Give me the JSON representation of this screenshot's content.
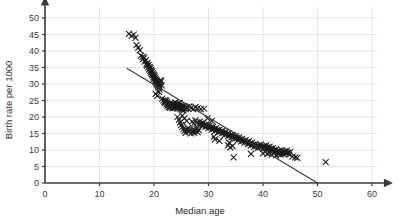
{
  "chart_data": {
    "type": "scatter",
    "title": "",
    "xlabel": "Median age",
    "ylabel": "Birth rate per 1000",
    "xlim": [
      0,
      62
    ],
    "ylim": [
      0,
      52
    ],
    "xticks": [
      0,
      10,
      20,
      30,
      40,
      50,
      60
    ],
    "yticks": [
      0,
      5,
      10,
      15,
      20,
      25,
      30,
      35,
      40,
      45,
      50
    ],
    "xtick_labels": [
      "0",
      "10",
      "20",
      "30",
      "40",
      "50",
      "60"
    ],
    "ytick_labels": [
      "0",
      "5",
      "10",
      "15",
      "20",
      "25",
      "30",
      "35",
      "40",
      "45",
      "50"
    ],
    "grid": true,
    "grid_color": "#e3e3e3",
    "axis_color": "#3a3a3a",
    "marker": "x",
    "marker_color": "#1a1a1a",
    "marker_size": 3.0,
    "legend": null,
    "trend_line": {
      "label": "",
      "color": "#3a3a3a",
      "x0": 15.0,
      "y0": 34.8,
      "x1": 50.0,
      "y1": 0.0
    },
    "annotations": [],
    "points": [
      [
        15.4,
        45.2
      ],
      [
        15.9,
        44.6
      ],
      [
        16.3,
        45.0
      ],
      [
        16.6,
        44.0
      ],
      [
        16.8,
        41.8
      ],
      [
        17.1,
        41.0
      ],
      [
        17.4,
        40.2
      ],
      [
        17.6,
        38.6
      ],
      [
        17.9,
        38.2
      ],
      [
        18.0,
        37.6
      ],
      [
        18.2,
        38.0
      ],
      [
        18.3,
        36.8
      ],
      [
        18.5,
        37.2
      ],
      [
        18.6,
        36.0
      ],
      [
        18.7,
        35.6
      ],
      [
        18.8,
        36.4
      ],
      [
        18.9,
        35.0
      ],
      [
        19.0,
        35.8
      ],
      [
        19.1,
        34.4
      ],
      [
        19.2,
        35.2
      ],
      [
        19.3,
        34.0
      ],
      [
        19.35,
        34.8
      ],
      [
        19.4,
        33.4
      ],
      [
        19.5,
        34.2
      ],
      [
        19.6,
        33.0
      ],
      [
        19.65,
        33.8
      ],
      [
        19.7,
        32.6
      ],
      [
        19.8,
        33.2
      ],
      [
        19.9,
        32.0
      ],
      [
        19.95,
        32.8
      ],
      [
        20.0,
        31.6
      ],
      [
        20.1,
        32.4
      ],
      [
        20.15,
        31.0
      ],
      [
        20.2,
        31.8
      ],
      [
        20.3,
        30.6
      ],
      [
        20.35,
        31.4
      ],
      [
        20.4,
        30.2
      ],
      [
        20.5,
        31.0
      ],
      [
        20.55,
        29.8
      ],
      [
        20.6,
        30.6
      ],
      [
        20.7,
        29.4
      ],
      [
        20.75,
        30.2
      ],
      [
        20.8,
        29.0
      ],
      [
        20.9,
        29.8
      ],
      [
        21.0,
        28.4
      ],
      [
        21.05,
        29.2
      ],
      [
        21.1,
        30.4
      ],
      [
        21.2,
        31.2
      ],
      [
        21.3,
        30.8
      ],
      [
        21.4,
        29.6
      ],
      [
        20.3,
        27.0
      ],
      [
        20.6,
        26.4
      ],
      [
        20.9,
        27.6
      ],
      [
        21.5,
        25.6
      ],
      [
        21.7,
        25.0
      ],
      [
        21.9,
        24.6
      ],
      [
        22.0,
        24.2
      ],
      [
        22.1,
        25.2
      ],
      [
        22.2,
        24.8
      ],
      [
        22.3,
        23.8
      ],
      [
        22.4,
        24.4
      ],
      [
        22.5,
        23.4
      ],
      [
        22.6,
        24.0
      ],
      [
        22.7,
        23.0
      ],
      [
        22.8,
        23.6
      ],
      [
        22.9,
        22.8
      ],
      [
        23.0,
        23.4
      ],
      [
        23.1,
        24.2
      ],
      [
        23.2,
        23.0
      ],
      [
        23.3,
        23.8
      ],
      [
        23.4,
        22.6
      ],
      [
        23.5,
        23.4
      ],
      [
        23.6,
        24.0
      ],
      [
        23.7,
        22.8
      ],
      [
        23.8,
        23.6
      ],
      [
        23.9,
        24.4
      ],
      [
        24.0,
        23.2
      ],
      [
        24.1,
        23.8
      ],
      [
        24.2,
        22.6
      ],
      [
        24.3,
        23.4
      ],
      [
        24.4,
        24.0
      ],
      [
        24.5,
        22.8
      ],
      [
        24.6,
        23.4
      ],
      [
        24.7,
        24.2
      ],
      [
        24.8,
        22.4
      ],
      [
        24.9,
        23.0
      ],
      [
        25.0,
        23.6
      ],
      [
        25.1,
        22.2
      ],
      [
        25.2,
        22.8
      ],
      [
        25.3,
        23.4
      ],
      [
        25.4,
        22.0
      ],
      [
        25.5,
        22.6
      ],
      [
        25.6,
        23.2
      ],
      [
        25.8,
        22.4
      ],
      [
        26.0,
        23.0
      ],
      [
        26.2,
        22.6
      ],
      [
        26.5,
        23.2
      ],
      [
        26.8,
        22.8
      ],
      [
        27.2,
        22.4
      ],
      [
        27.6,
        23.0
      ],
      [
        28.0,
        22.6
      ],
      [
        28.6,
        22.4
      ],
      [
        29.2,
        22.5
      ],
      [
        24.3,
        20.0
      ],
      [
        24.6,
        19.2
      ],
      [
        24.8,
        18.4
      ],
      [
        25.0,
        17.6
      ],
      [
        25.2,
        17.0
      ],
      [
        25.4,
        16.4
      ],
      [
        25.6,
        15.8
      ],
      [
        25.8,
        15.2
      ],
      [
        26.0,
        16.0
      ],
      [
        26.2,
        16.6
      ],
      [
        26.4,
        15.6
      ],
      [
        26.6,
        16.2
      ],
      [
        26.8,
        15.0
      ],
      [
        27.0,
        15.6
      ],
      [
        27.2,
        16.2
      ],
      [
        27.4,
        15.2
      ],
      [
        27.6,
        15.8
      ],
      [
        27.8,
        16.4
      ],
      [
        28.0,
        15.4
      ],
      [
        28.2,
        16.0
      ],
      [
        27.0,
        18.6
      ],
      [
        27.3,
        18.0
      ],
      [
        27.6,
        19.0
      ],
      [
        27.9,
        18.4
      ],
      [
        28.2,
        17.8
      ],
      [
        28.4,
        18.6
      ],
      [
        28.6,
        18.0
      ],
      [
        28.8,
        17.4
      ],
      [
        29.0,
        18.2
      ],
      [
        29.2,
        17.6
      ],
      [
        29.4,
        17.0
      ],
      [
        29.6,
        17.8
      ],
      [
        29.8,
        17.2
      ],
      [
        30.0,
        16.6
      ],
      [
        30.2,
        17.4
      ],
      [
        30.4,
        16.8
      ],
      [
        30.6,
        16.2
      ],
      [
        30.8,
        17.0
      ],
      [
        31.0,
        16.4
      ],
      [
        31.2,
        15.8
      ],
      [
        31.4,
        16.6
      ],
      [
        31.6,
        16.0
      ],
      [
        31.8,
        15.4
      ],
      [
        32.0,
        16.2
      ],
      [
        32.2,
        15.6
      ],
      [
        32.4,
        15.0
      ],
      [
        32.6,
        15.8
      ],
      [
        32.8,
        15.2
      ],
      [
        33.0,
        14.6
      ],
      [
        33.2,
        15.4
      ],
      [
        33.4,
        14.8
      ],
      [
        33.6,
        14.2
      ],
      [
        33.8,
        15.0
      ],
      [
        34.0,
        14.4
      ],
      [
        34.2,
        13.8
      ],
      [
        34.4,
        14.6
      ],
      [
        34.6,
        14.0
      ],
      [
        34.8,
        13.4
      ],
      [
        35.0,
        14.2
      ],
      [
        35.2,
        13.6
      ],
      [
        35.4,
        13.0
      ],
      [
        35.6,
        13.8
      ],
      [
        35.8,
        13.2
      ],
      [
        36.0,
        12.6
      ],
      [
        36.2,
        13.4
      ],
      [
        36.4,
        12.8
      ],
      [
        36.6,
        12.2
      ],
      [
        36.8,
        13.0
      ],
      [
        37.0,
        12.4
      ],
      [
        37.2,
        11.8
      ],
      [
        37.4,
        12.6
      ],
      [
        37.6,
        12.0
      ],
      [
        37.8,
        11.4
      ],
      [
        38.0,
        12.2
      ],
      [
        38.2,
        11.6
      ],
      [
        38.4,
        11.0
      ],
      [
        38.6,
        11.8
      ],
      [
        38.8,
        11.2
      ],
      [
        39.0,
        10.6
      ],
      [
        39.2,
        11.4
      ],
      [
        39.4,
        10.8
      ],
      [
        39.6,
        11.6
      ],
      [
        39.8,
        11.0
      ],
      [
        40.0,
        10.4
      ],
      [
        40.2,
        11.2
      ],
      [
        40.4,
        10.6
      ],
      [
        40.6,
        11.4
      ],
      [
        40.8,
        10.8
      ],
      [
        41.0,
        10.2
      ],
      [
        41.2,
        11.0
      ],
      [
        41.4,
        10.4
      ],
      [
        41.6,
        9.8
      ],
      [
        41.8,
        10.6
      ],
      [
        42.0,
        10.0
      ],
      [
        42.2,
        9.4
      ],
      [
        42.4,
        10.2
      ],
      [
        42.6,
        9.6
      ],
      [
        42.8,
        9.0
      ],
      [
        43.0,
        9.8
      ],
      [
        43.2,
        9.2
      ],
      [
        43.4,
        10.0
      ],
      [
        43.6,
        9.4
      ],
      [
        43.8,
        8.8
      ],
      [
        44.0,
        9.6
      ],
      [
        44.2,
        9.0
      ],
      [
        44.4,
        9.8
      ],
      [
        44.6,
        9.2
      ],
      [
        44.8,
        8.6
      ],
      [
        45.0,
        9.4
      ],
      [
        45.4,
        8.0
      ],
      [
        45.9,
        7.8
      ],
      [
        46.3,
        7.6
      ],
      [
        40.0,
        9.0
      ],
      [
        40.4,
        9.4
      ],
      [
        40.8,
        8.8
      ],
      [
        41.2,
        9.2
      ],
      [
        41.6,
        8.6
      ],
      [
        42.0,
        9.0
      ],
      [
        42.4,
        8.4
      ],
      [
        42.8,
        8.8
      ],
      [
        43.2,
        8.6
      ],
      [
        43.6,
        9.0
      ],
      [
        33.6,
        11.4
      ],
      [
        34.0,
        10.8
      ],
      [
        34.4,
        11.2
      ],
      [
        33.8,
        12.2
      ],
      [
        34.6,
        7.8
      ],
      [
        37.8,
        8.8
      ],
      [
        31.2,
        13.2
      ],
      [
        32.0,
        12.8
      ],
      [
        30.6,
        18.8
      ],
      [
        31.0,
        14.0
      ],
      [
        29.8,
        19.6
      ],
      [
        25.2,
        20.4
      ],
      [
        25.6,
        19.6
      ],
      [
        26.0,
        18.8
      ],
      [
        51.5,
        6.3
      ]
    ],
    "outlier_note": "single isolated point near median age 51.5, birth rate 6.3"
  }
}
